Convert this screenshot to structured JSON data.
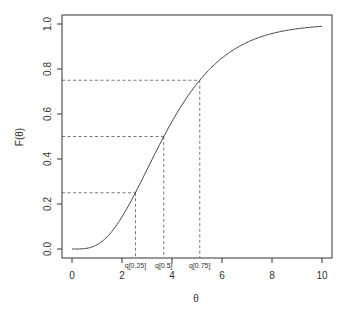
{
  "chart_data": {
    "type": "line",
    "title": "",
    "xlabel": "θ",
    "ylabel": "F(θ)",
    "xlim": [
      0,
      10
    ],
    "ylim": [
      0,
      1
    ],
    "grid": false,
    "legend": "none",
    "x_ticks": [
      0,
      2,
      4,
      6,
      8,
      10
    ],
    "x_tick_labels": [
      "0",
      "2",
      "4",
      "6",
      "8",
      "10"
    ],
    "y_ticks": [
      0.0,
      0.2,
      0.4,
      0.6,
      0.8,
      1.0
    ],
    "y_tick_labels": [
      "0.0",
      "0.2",
      "0.4",
      "0.6",
      "0.8",
      "1.0"
    ],
    "series": [
      {
        "name": "CDF",
        "description": "Gamma(shape=4, rate=1) cumulative distribution function",
        "x": [
          0,
          0.5,
          1,
          1.5,
          2,
          2.5,
          3,
          3.5,
          4,
          4.5,
          5,
          5.5,
          6,
          6.5,
          7,
          7.5,
          8,
          8.5,
          9,
          9.5,
          10
        ],
        "y": [
          0.0,
          0.002,
          0.019,
          0.066,
          0.143,
          0.242,
          0.353,
          0.463,
          0.567,
          0.658,
          0.735,
          0.798,
          0.849,
          0.888,
          0.918,
          0.941,
          0.958,
          0.97,
          0.979,
          0.985,
          0.99
        ]
      }
    ],
    "quantiles": [
      {
        "label": "q[0.25]",
        "p": 0.25,
        "theta": 2.54
      },
      {
        "label": "q[0.5]",
        "p": 0.5,
        "theta": 3.67
      },
      {
        "label": "q[0.75]",
        "p": 0.75,
        "theta": 5.11
      }
    ]
  }
}
